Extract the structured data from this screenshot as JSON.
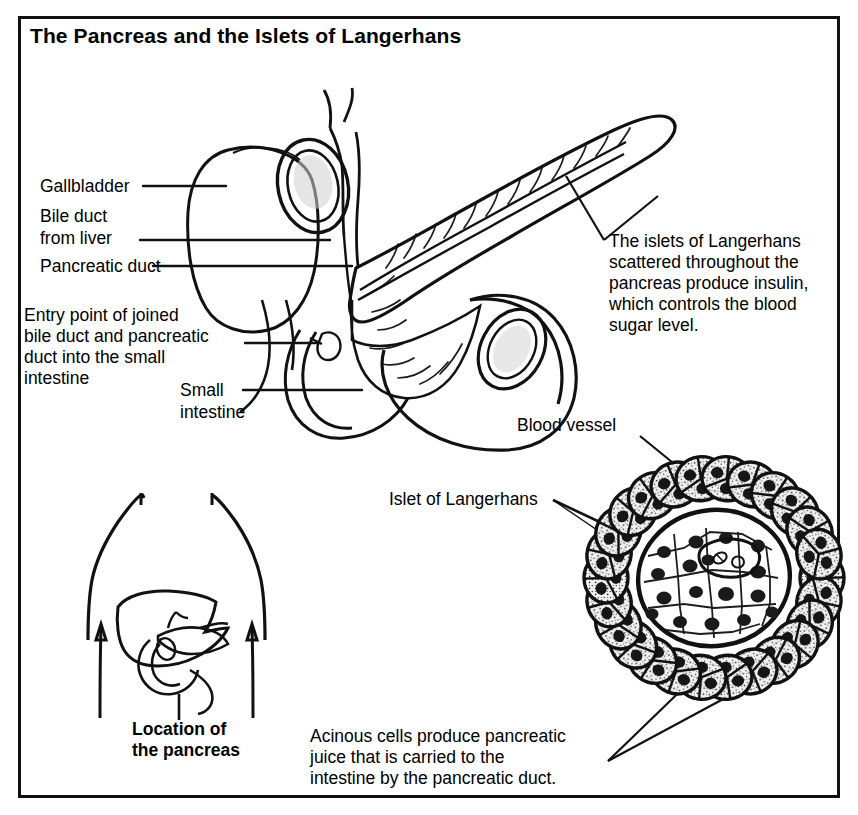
{
  "figure": {
    "title": "The Pancreas and the Islets of Langerhans",
    "border_color": "#111111",
    "background_color": "#ffffff",
    "ink_color": "#111111",
    "islet_fill_color": "#a8a8a8"
  },
  "labels": {
    "gallbladder": "Gallbladder",
    "bile_duct_line1": "Bile duct",
    "bile_duct_line2": "from liver",
    "pancreatic_duct": "Pancreatic duct",
    "entry_point_line1": "Entry point of joined",
    "entry_point_line2": "bile duct and pancreatic",
    "entry_point_line3": "duct into the small",
    "entry_point_line4": "intestine",
    "small_intestine_line1": "Small",
    "small_intestine_line2": "intestine",
    "blood_vessel": "Blood vessel",
    "islet_of_langerhans": "Islet of Langerhans",
    "location_line1": "Location of",
    "location_line2": "the pancreas"
  },
  "notes": {
    "islets_note": {
      "line1": "The islets of Langerhans",
      "line2": "scattered throughout the",
      "line3": "pancreas produce insulin,",
      "line4": "which controls the blood",
      "line5": "sugar level."
    },
    "acinous_note": {
      "line1": "Acinous cells produce pancreatic",
      "line2": "juice that is carried to the",
      "line3": "intestine by the pancreatic duct."
    }
  },
  "diagrams": {
    "organ_view": "pancreas-gallbladder-duodenum-line-art",
    "body_view": "torso-silhouette-with-liver-and-pancreas",
    "micrograph_view": "islet-of-langerhans-surrounded-by-acinar-cells"
  }
}
